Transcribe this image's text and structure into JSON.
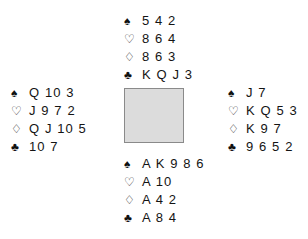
{
  "diagram": {
    "type": "bridge-deal",
    "suit_symbols": {
      "spade": "♠",
      "heart": "♡",
      "diamond": "♢",
      "club": "♣"
    },
    "center_box_color": "#dcdcdc",
    "center_box_border_color": "#8a8a8a",
    "hands": {
      "north": {
        "position": "North",
        "spades": "5 4 2",
        "hearts": "8 6 4",
        "diamonds": "8 6 3",
        "clubs": "K Q J 3"
      },
      "west": {
        "position": "West",
        "spades": "Q 10 3",
        "hearts": "J 9 7 2",
        "diamonds": "Q J 10 5",
        "clubs": "10 7"
      },
      "east": {
        "position": "East",
        "spades": "J 7",
        "hearts": "K Q 5 3",
        "diamonds": "K 9 7",
        "clubs": "9 6 5 2"
      },
      "south": {
        "position": "South",
        "spades": "A K 9 8 6",
        "hearts": "A 10",
        "diamonds": "A 4 2",
        "clubs": "A 8 4"
      }
    }
  }
}
